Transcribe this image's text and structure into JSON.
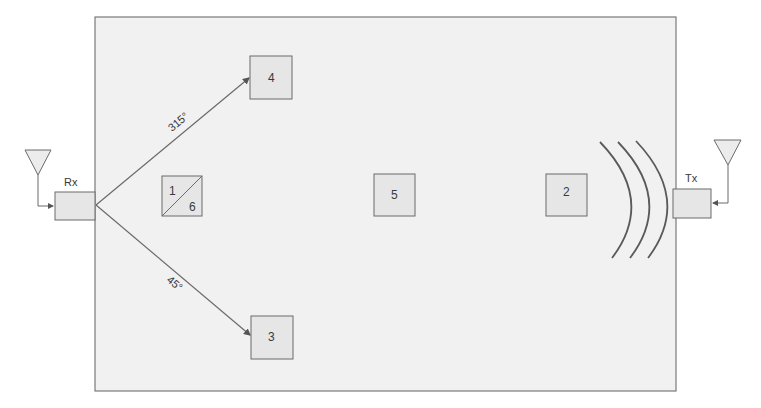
{
  "diagram": {
    "type": "wireless-signal-reflection-layout",
    "colors": {
      "line": "#6b6b6b",
      "box_fill": "#e6e6e6",
      "room_fill": "#f1f1f1",
      "text": "#3a3a3a",
      "antenna_fill": "#ececec"
    },
    "receiver": {
      "label": "Rx",
      "icon": "antenna-icon"
    },
    "transmitter": {
      "label": "Tx",
      "icon": "antenna-icon"
    },
    "signal_waves": {
      "icon": "signal-wave-icon",
      "count": 3
    },
    "positions": [
      {
        "id": "1-6",
        "top_label": "1",
        "bottom_label": "6",
        "split": true
      },
      {
        "id": "2",
        "label": "2"
      },
      {
        "id": "3",
        "label": "3"
      },
      {
        "id": "4",
        "label": "4"
      },
      {
        "id": "5",
        "label": "5"
      }
    ],
    "angles": {
      "upper": "315°",
      "lower": "45°"
    }
  }
}
